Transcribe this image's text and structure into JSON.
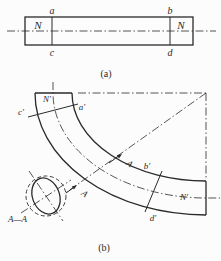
{
  "colors": {
    "line": "#2a2a2a",
    "background": "#fcfcfc"
  },
  "figure_a": {
    "caption": "(a)",
    "label_a": "a",
    "label_b": "b",
    "label_c": "c",
    "label_d": "d",
    "label_n_left": "N",
    "label_n_right": "N"
  },
  "figure_b": {
    "caption": "(b)",
    "label_n_top": "N′",
    "label_c_prime": "c′",
    "label_a_prime": "a′",
    "label_b_prime": "b′",
    "label_n_bottom": "N′",
    "label_d_prime": "d′",
    "arrow_label_upper": "A",
    "arrow_label_lower": "A",
    "section_view_label": "A—A"
  }
}
